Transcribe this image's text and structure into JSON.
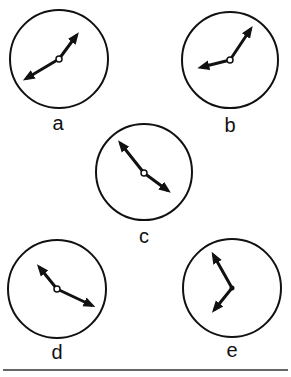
{
  "figure": {
    "clocks": [
      {
        "label": "a",
        "hour_hand_points_to": "about 8",
        "minute_hand_points_to": "about 1 (5 min)"
      },
      {
        "label": "b",
        "hour_hand_points_to": "about 8 to 9",
        "minute_hand_points_to": "about 1 (5 min)"
      },
      {
        "label": "c",
        "hour_hand_points_to": "about 4",
        "minute_hand_points_to": "about 10 to 11 (52 min)"
      },
      {
        "label": "d",
        "hour_hand_points_to": "about 4",
        "minute_hand_points_to": "about 10 (50 min)"
      },
      {
        "label": "e",
        "hour_hand_points_to": "about 7",
        "minute_hand_points_to": "about 11 (55 min)"
      }
    ],
    "colors": {
      "ink": "#111111",
      "background": "#ffffff"
    }
  }
}
